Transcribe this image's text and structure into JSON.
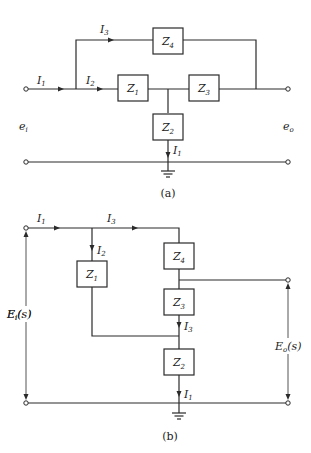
{
  "diagram_a": {
    "caption": "(a)",
    "impedances": [
      {
        "id": "Z1",
        "base": "Z",
        "sub": "1"
      },
      {
        "id": "Z2",
        "base": "Z",
        "sub": "2"
      },
      {
        "id": "Z3",
        "base": "Z",
        "sub": "3"
      },
      {
        "id": "Z4",
        "base": "Z",
        "sub": "4"
      }
    ],
    "currents": [
      {
        "id": "I1_in",
        "base": "I",
        "sub": "1"
      },
      {
        "id": "I2",
        "base": "I",
        "sub": "2"
      },
      {
        "id": "I3",
        "base": "I",
        "sub": "3"
      },
      {
        "id": "I1_ground",
        "base": "I",
        "sub": "1"
      }
    ],
    "input_voltage": {
      "base": "e",
      "sub": "i"
    },
    "output_voltage": {
      "base": "e",
      "sub": "o"
    }
  },
  "diagram_b": {
    "caption": "(b)",
    "impedances": [
      {
        "id": "Z1",
        "base": "Z",
        "sub": "1"
      },
      {
        "id": "Z4",
        "base": "Z",
        "sub": "4"
      },
      {
        "id": "Z3",
        "base": "Z",
        "sub": "3"
      },
      {
        "id": "Z2",
        "base": "Z",
        "sub": "2"
      }
    ],
    "currents": [
      {
        "id": "I1_in",
        "base": "I",
        "sub": "1"
      },
      {
        "id": "I3_top",
        "base": "I",
        "sub": "3"
      },
      {
        "id": "I2",
        "base": "I",
        "sub": "2"
      },
      {
        "id": "I3_mid",
        "base": "I",
        "sub": "3"
      },
      {
        "id": "I1_ground",
        "base": "I",
        "sub": "1"
      }
    ],
    "input_voltage": {
      "base": "E",
      "sub": "i",
      "suffix": "(s)"
    },
    "output_voltage": {
      "base": "E",
      "sub": "o",
      "suffix": "(s)"
    }
  }
}
